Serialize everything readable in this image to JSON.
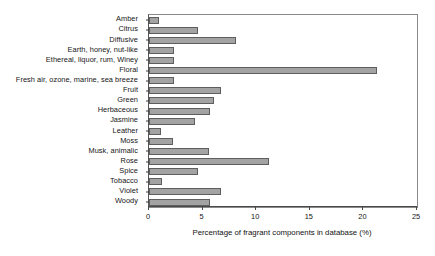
{
  "chart_data": {
    "type": "bar",
    "orientation": "horizontal",
    "title": "",
    "xlabel": "Percentage of fragrant components in database (%)",
    "ylabel": "",
    "xlim": [
      0,
      25
    ],
    "xticks": [
      0,
      5,
      10,
      15,
      20,
      25
    ],
    "xtick_labels": [
      "0",
      "5",
      "10",
      "15",
      "20",
      "25"
    ],
    "grid": false,
    "legend": null,
    "bar_color": "#a3a3a3",
    "bar_edge_color": "#5e5e5e",
    "categories": [
      "Amber",
      "Citrus",
      "Diffusive",
      "Earth, honey, nut-like",
      "Ethereal, liquor, rum, Winey",
      "Floral",
      "Fresh air, ozone, marine, sea breeze",
      "Fruit",
      "Green",
      "Herbaceous",
      "Jasmine",
      "Leather",
      "Moss",
      "Musk, animalic",
      "Rose",
      "Spice",
      "Tobacco",
      "Violet",
      "Woody"
    ],
    "values": [
      0.9,
      4.6,
      8.1,
      2.3,
      2.3,
      21.3,
      2.3,
      6.7,
      6.1,
      5.7,
      4.3,
      1.1,
      2.2,
      5.6,
      11.2,
      4.6,
      1.2,
      6.7,
      5.7
    ]
  }
}
